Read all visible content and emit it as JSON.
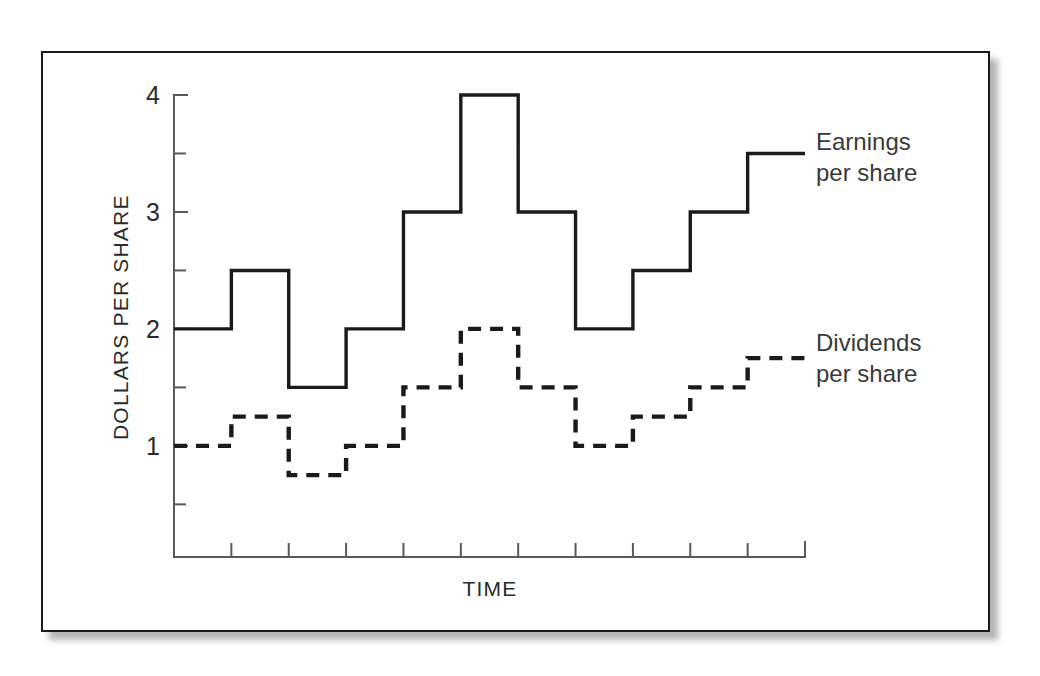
{
  "figure": {
    "frame_color": "#1a1a1a",
    "background": "#ffffff",
    "shadow_color": "#9a9a9a"
  },
  "axes": {
    "ylabel": "DOLLARS PER SHARE",
    "xlabel": "TIME",
    "y_major_labels": [
      "4",
      "3",
      "2",
      "1"
    ],
    "y_major_values": [
      4,
      3,
      2,
      1
    ],
    "y_minor_values": [
      3.5,
      2.5,
      1.5,
      0.5
    ],
    "x_tick_count": 11,
    "x_tick_labels": []
  },
  "legend": {
    "earnings": {
      "line1": "Earnings",
      "line2": "per share",
      "style": "solid"
    },
    "dividends": {
      "line1": "Dividends",
      "line2": "per share",
      "style": "dashed"
    }
  },
  "chart_data": {
    "type": "line",
    "subtype": "step",
    "title": "",
    "xlabel": "TIME",
    "ylabel": "DOLLARS PER SHARE",
    "ylim": [
      0.05,
      4.25
    ],
    "xlim": [
      0,
      11
    ],
    "grid": false,
    "legend_position": "right-inline",
    "x": [
      0,
      1,
      2,
      3,
      4,
      5,
      6,
      7,
      8,
      9,
      10,
      11
    ],
    "categories": [
      "1",
      "2",
      "3",
      "4",
      "5",
      "6",
      "7",
      "8",
      "9",
      "10",
      "11"
    ],
    "series": [
      {
        "name": "Earnings per share",
        "style": "solid",
        "color": "#1a1a1a",
        "values": [
          2,
          2.5,
          1.5,
          2,
          3,
          4,
          3,
          2,
          2.5,
          3,
          3.5
        ]
      },
      {
        "name": "Dividends per share",
        "style": "dashed",
        "color": "#1a1a1a",
        "values": [
          1,
          1.25,
          0.75,
          1,
          1.5,
          2,
          1.5,
          1,
          1.25,
          1.5,
          1.75
        ]
      }
    ],
    "annotations": [
      {
        "text": "Earnings per share",
        "at_series": 0,
        "at_step": 10
      },
      {
        "text": "Dividends per share",
        "at_series": 1,
        "at_step": 10
      }
    ]
  }
}
